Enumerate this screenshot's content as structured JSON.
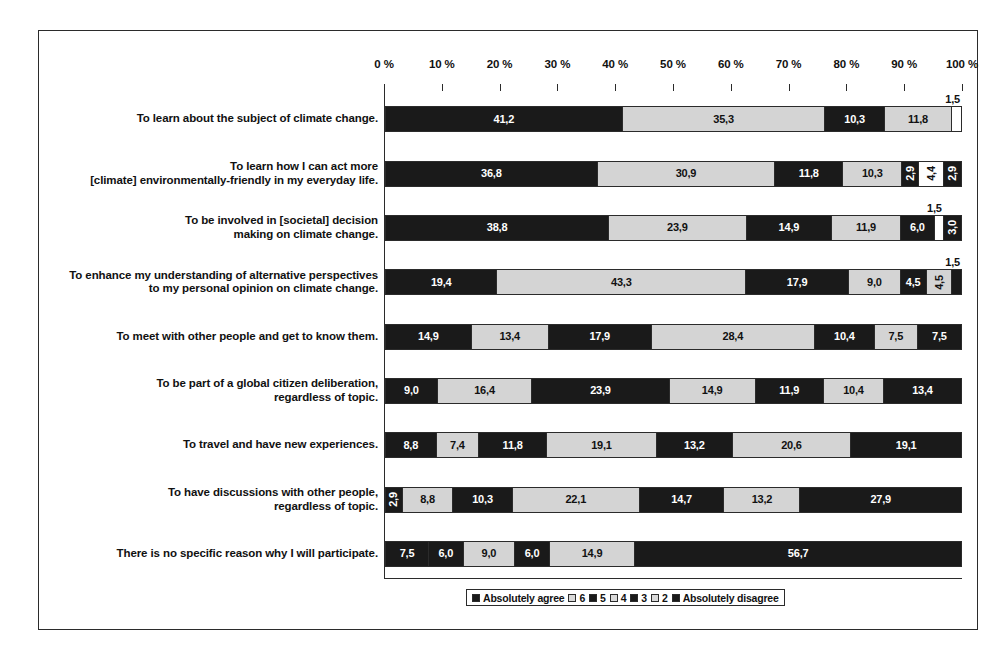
{
  "chart_data": {
    "type": "bar",
    "orientation": "horizontal",
    "stacked": true,
    "stack_mode": "percent",
    "title": "",
    "xlabel": "",
    "ylabel": "",
    "xlim": [
      0,
      100
    ],
    "grid": false,
    "legend_position": "bottom",
    "axis_tick_labels": [
      "0 %",
      "10 %",
      "20 %",
      "30 %",
      "40 %",
      "50 %",
      "60 %",
      "70 %",
      "80 %",
      "90 %",
      "100 %"
    ],
    "axis_tick_values": [
      0,
      10,
      20,
      30,
      40,
      50,
      60,
      70,
      80,
      90,
      100
    ],
    "legend_entries": [
      {
        "label": "Absolutely agree",
        "shade": "dark"
      },
      {
        "label": "6",
        "shade": "light"
      },
      {
        "label": "5",
        "shade": "dark"
      },
      {
        "label": "4",
        "shade": "light"
      },
      {
        "label": "3",
        "shade": "dark"
      },
      {
        "label": "2",
        "shade": "light"
      },
      {
        "label": "Absolutely disagree",
        "shade": "dark"
      }
    ],
    "categories": [
      "To learn about the subject of climate change.",
      "To learn how I can act more\n[climate] environmentally-friendly in my everyday life.",
      "To be involved in [societal] decision\nmaking on climate change.",
      "To enhance my understanding of alternative perspectives\nto my personal opinion on climate change.",
      "To meet with other people and get to know them.",
      "To be part of a global citizen deliberation,\nregardless of topic.",
      "To travel and have new experiences.",
      "To have discussions with other people,\nregardless of topic.",
      "There is no specific reason why I will participate."
    ],
    "series": [
      {
        "name": "Absolutely agree",
        "values": [
          41.2,
          36.8,
          38.8,
          19.4,
          14.9,
          9.0,
          8.8,
          2.9,
          7.5
        ]
      },
      {
        "name": "6",
        "values": [
          35.3,
          30.9,
          23.9,
          43.3,
          13.4,
          16.4,
          7.4,
          8.8,
          6.0
        ]
      },
      {
        "name": "5",
        "values": [
          10.3,
          11.8,
          14.9,
          17.9,
          17.9,
          23.9,
          11.8,
          10.3,
          9.0
        ]
      },
      {
        "name": "4",
        "values": [
          11.8,
          10.3,
          11.9,
          9.0,
          28.4,
          14.9,
          19.1,
          22.1,
          6.0
        ]
      },
      {
        "name": "3",
        "values": [
          1.5,
          2.9,
          6.0,
          4.5,
          10.4,
          11.9,
          13.2,
          14.7,
          14.9
        ]
      },
      {
        "name": "2",
        "values": [
          0.0,
          4.4,
          1.5,
          4.5,
          7.5,
          10.4,
          20.6,
          13.2,
          0.0
        ]
      },
      {
        "name": "Absolutely disagree",
        "values": [
          0.0,
          2.9,
          3.0,
          1.5,
          7.5,
          13.4,
          19.1,
          27.9,
          56.7
        ]
      }
    ],
    "rows": [
      {
        "category": "To learn about the subject of climate change.",
        "category_lines": [
          "To learn about the subject of climate change."
        ],
        "segments": [
          {
            "value": 41.2,
            "label": "41,2",
            "shade": "dark",
            "label_position": "inside"
          },
          {
            "value": 35.3,
            "label": "35,3",
            "shade": "light",
            "label_position": "inside"
          },
          {
            "value": 10.3,
            "label": "10,3",
            "shade": "dark",
            "label_position": "inside"
          },
          {
            "value": 11.8,
            "label": "11,8",
            "shade": "light",
            "label_position": "inside"
          },
          {
            "value": 1.5,
            "label": "1,5",
            "shade": "white",
            "label_position": "above"
          }
        ]
      },
      {
        "category": "To learn how I can act more [climate] environmentally-friendly in my everyday life.",
        "category_lines": [
          "To learn how I can act more",
          "[climate] environmentally-friendly in my everyday life."
        ],
        "segments": [
          {
            "value": 36.8,
            "label": "36,8",
            "shade": "dark",
            "label_position": "inside"
          },
          {
            "value": 30.9,
            "label": "30,9",
            "shade": "light",
            "label_position": "inside"
          },
          {
            "value": 11.8,
            "label": "11,8",
            "shade": "dark",
            "label_position": "inside"
          },
          {
            "value": 10.3,
            "label": "10,3",
            "shade": "light",
            "label_position": "inside"
          },
          {
            "value": 2.9,
            "label": "2,9",
            "shade": "dark",
            "label_position": "rotated"
          },
          {
            "value": 4.4,
            "label": "4,4",
            "shade": "white",
            "label_position": "rotated"
          },
          {
            "value": 2.9,
            "label": "2,9",
            "shade": "dark",
            "label_position": "rotated"
          }
        ]
      },
      {
        "category": "To be involved in [societal] decision making on climate change.",
        "category_lines": [
          "To be involved in [societal] decision",
          "making on climate change."
        ],
        "segments": [
          {
            "value": 38.8,
            "label": "38,8",
            "shade": "dark",
            "label_position": "inside"
          },
          {
            "value": 23.9,
            "label": "23,9",
            "shade": "light",
            "label_position": "inside"
          },
          {
            "value": 14.9,
            "label": "14,9",
            "shade": "dark",
            "label_position": "inside"
          },
          {
            "value": 11.9,
            "label": "11,9",
            "shade": "light",
            "label_position": "inside"
          },
          {
            "value": 6.0,
            "label": "6,0",
            "shade": "dark",
            "label_position": "inside"
          },
          {
            "value": 1.5,
            "label": "1,5",
            "shade": "white",
            "label_position": "above"
          },
          {
            "value": 3.0,
            "label": "3,0",
            "shade": "dark",
            "label_position": "rotated"
          }
        ]
      },
      {
        "category": "To enhance my understanding of alternative perspectives to my personal opinion on climate change.",
        "category_lines": [
          "To enhance my understanding of alternative perspectives",
          "to my personal opinion on climate change."
        ],
        "segments": [
          {
            "value": 19.4,
            "label": "19,4",
            "shade": "dark",
            "label_position": "inside"
          },
          {
            "value": 43.3,
            "label": "43,3",
            "shade": "light",
            "label_position": "inside"
          },
          {
            "value": 17.9,
            "label": "17,9",
            "shade": "dark",
            "label_position": "inside"
          },
          {
            "value": 9.0,
            "label": "9,0",
            "shade": "light",
            "label_position": "inside"
          },
          {
            "value": 4.5,
            "label": "4,5",
            "shade": "dark",
            "label_position": "inside"
          },
          {
            "value": 4.5,
            "label": "4,5",
            "shade": "light",
            "label_position": "rotated"
          },
          {
            "value": 1.5,
            "label": "1,5",
            "shade": "dark",
            "label_position": "above"
          }
        ]
      },
      {
        "category": "To meet with other people and get to know them.",
        "category_lines": [
          "To meet with other people and get to know them."
        ],
        "segments": [
          {
            "value": 14.9,
            "label": "14,9",
            "shade": "dark",
            "label_position": "inside"
          },
          {
            "value": 13.4,
            "label": "13,4",
            "shade": "light",
            "label_position": "inside"
          },
          {
            "value": 17.9,
            "label": "17,9",
            "shade": "dark",
            "label_position": "inside"
          },
          {
            "value": 28.4,
            "label": "28,4",
            "shade": "light",
            "label_position": "inside"
          },
          {
            "value": 10.4,
            "label": "10,4",
            "shade": "dark",
            "label_position": "inside"
          },
          {
            "value": 7.5,
            "label": "7,5",
            "shade": "light",
            "label_position": "inside"
          },
          {
            "value": 7.5,
            "label": "7,5",
            "shade": "dark",
            "label_position": "inside"
          }
        ]
      },
      {
        "category": "To be part of a global citizen deliberation, regardless of topic.",
        "category_lines": [
          "To be part of a global citizen deliberation,",
          "regardless of topic."
        ],
        "segments": [
          {
            "value": 9.0,
            "label": "9,0",
            "shade": "dark",
            "label_position": "inside"
          },
          {
            "value": 16.4,
            "label": "16,4",
            "shade": "light",
            "label_position": "inside"
          },
          {
            "value": 23.9,
            "label": "23,9",
            "shade": "dark",
            "label_position": "inside"
          },
          {
            "value": 14.9,
            "label": "14,9",
            "shade": "light",
            "label_position": "inside"
          },
          {
            "value": 11.9,
            "label": "11,9",
            "shade": "dark",
            "label_position": "inside"
          },
          {
            "value": 10.4,
            "label": "10,4",
            "shade": "light",
            "label_position": "inside"
          },
          {
            "value": 13.4,
            "label": "13,4",
            "shade": "dark",
            "label_position": "inside"
          }
        ]
      },
      {
        "category": "To travel and have new experiences.",
        "category_lines": [
          "To travel and have new experiences."
        ],
        "segments": [
          {
            "value": 8.8,
            "label": "8,8",
            "shade": "dark",
            "label_position": "inside"
          },
          {
            "value": 7.4,
            "label": "7,4",
            "shade": "light",
            "label_position": "inside"
          },
          {
            "value": 11.8,
            "label": "11,8",
            "shade": "dark",
            "label_position": "inside"
          },
          {
            "value": 19.1,
            "label": "19,1",
            "shade": "light",
            "label_position": "inside"
          },
          {
            "value": 13.2,
            "label": "13,2",
            "shade": "dark",
            "label_position": "inside"
          },
          {
            "value": 20.6,
            "label": "20,6",
            "shade": "light",
            "label_position": "inside"
          },
          {
            "value": 19.1,
            "label": "19,1",
            "shade": "dark",
            "label_position": "inside"
          }
        ]
      },
      {
        "category": "To have discussions with other people, regardless of topic.",
        "category_lines": [
          "To have discussions with other people,",
          "regardless of topic."
        ],
        "segments": [
          {
            "value": 2.9,
            "label": "2,9",
            "shade": "dark",
            "label_position": "rotated"
          },
          {
            "value": 8.8,
            "label": "8,8",
            "shade": "light",
            "label_position": "inside"
          },
          {
            "value": 10.3,
            "label": "10,3",
            "shade": "dark",
            "label_position": "inside"
          },
          {
            "value": 22.1,
            "label": "22,1",
            "shade": "light",
            "label_position": "inside"
          },
          {
            "value": 14.7,
            "label": "14,7",
            "shade": "dark",
            "label_position": "inside"
          },
          {
            "value": 13.2,
            "label": "13,2",
            "shade": "light",
            "label_position": "inside"
          },
          {
            "value": 27.9,
            "label": "27,9",
            "shade": "dark",
            "label_position": "inside"
          }
        ]
      },
      {
        "category": "There is no specific reason why I will participate.",
        "category_lines": [
          "There is no specific reason why I will participate."
        ],
        "segments": [
          {
            "value": 7.5,
            "label": "7,5",
            "shade": "dark",
            "label_position": "inside"
          },
          {
            "value": 6.0,
            "label": "6,0",
            "shade": "dark",
            "label_position": "inside"
          },
          {
            "value": 9.0,
            "label": "9,0",
            "shade": "light",
            "label_position": "inside"
          },
          {
            "value": 6.0,
            "label": "6,0",
            "shade": "dark",
            "label_position": "inside"
          },
          {
            "value": 14.9,
            "label": "14,9",
            "shade": "light",
            "label_position": "inside"
          },
          {
            "value": 56.7,
            "label": "56,7",
            "shade": "dark",
            "label_position": "inside"
          }
        ]
      }
    ],
    "colors": {
      "dark": "#1a1a1a",
      "light": "#d4d4d4",
      "white": "#fefefe",
      "outline": "#2b2b2b",
      "text": "#111111"
    }
  }
}
